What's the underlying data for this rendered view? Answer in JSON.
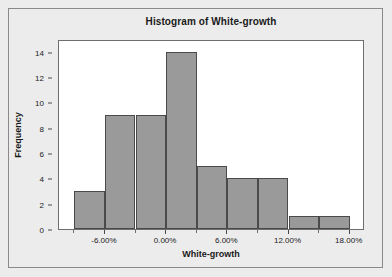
{
  "chart_data": {
    "type": "bar",
    "title": "Histogram of White-growth",
    "xlabel": "White-growth",
    "ylabel": "Frequency",
    "bin_width_percent": 3,
    "bin_starts_percent": [
      -9,
      -6,
      -3,
      0,
      3,
      6,
      9,
      12,
      15
    ],
    "categories": [
      "-9.00% to -6.00%",
      "-6.00% to -3.00%",
      "-3.00% to 0.00%",
      "0.00% to 3.00%",
      "3.00% to 6.00%",
      "6.00% to 9.00%",
      "9.00% to 12.00%",
      "12.00% to 15.00%",
      "15.00% to 18.00%"
    ],
    "values": [
      3,
      9,
      9,
      14,
      5,
      4,
      4,
      1,
      1
    ],
    "ylim": [
      0,
      15
    ],
    "xlim_percent": [
      -10.5,
      19.5
    ],
    "y_ticks": [
      0,
      2,
      4,
      6,
      8,
      10,
      12,
      14
    ],
    "y_tick_labels": [
      "0",
      "2",
      "4",
      "6",
      "8",
      "10",
      "12",
      "14"
    ],
    "x_ticks_percent": [
      -6,
      0,
      6,
      12,
      18
    ],
    "x_tick_labels": [
      "-6.00%",
      "0.00%",
      "6.00%",
      "12.00%",
      "18.00%"
    ],
    "grid": false,
    "legend": null,
    "bar_fill_color": "#9a9a9a",
    "bar_edge_color": "#4a4a4a",
    "plot_background": "#ffffff",
    "figure_background": "#ececec"
  }
}
